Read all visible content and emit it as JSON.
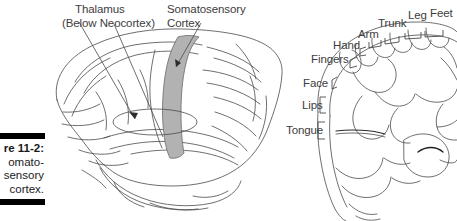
{
  "figure": {
    "caption_lines": [
      "re 11-2:",
      "omato-",
      "sensory",
      "cortex."
    ],
    "caption_full_intent": "Figure 11-2: The somatosensory cortex."
  },
  "callouts": {
    "thalamus_line1": "Thalamus",
    "thalamus_line2": "(Below Neocortex)",
    "somatosensory_line1": "Somatosensory",
    "somatosensory_line2": "Cortex"
  },
  "homunculus_labels": {
    "top": [
      {
        "name": "Arm",
        "text": "Arm"
      },
      {
        "name": "Trunk",
        "text": "Trunk"
      },
      {
        "name": "Leg",
        "text": "Leg"
      },
      {
        "name": "Feet",
        "text": "Feet"
      }
    ],
    "left": [
      {
        "name": "Hand",
        "text": "Hand"
      },
      {
        "name": "Fingers",
        "text": "Fingers"
      },
      {
        "name": "Face",
        "text": "Face"
      },
      {
        "name": "Lips",
        "text": "Lips"
      },
      {
        "name": "Tongue",
        "text": "Tongue"
      }
    ]
  },
  "colors": {
    "ink": "#3a3a3a",
    "outline": "#4a4a4a",
    "strip_fill": "#b2b2b2",
    "caption_bar": "#000000",
    "background": "#ffffff"
  }
}
